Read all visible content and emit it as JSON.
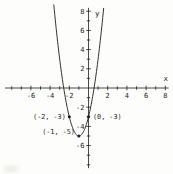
{
  "chart_data": {
    "type": "line",
    "subtype": "quadratic-function-plot",
    "equation": "y = 2(x+1)^2 - 5",
    "coefficients": {
      "a": 2,
      "h": -1,
      "k": -5
    },
    "vertex": {
      "x": -1,
      "y": -5
    },
    "x_axis": {
      "label": "x",
      "min": -8,
      "max": 8,
      "tick_step": 1,
      "labeled_ticks": [
        -6,
        -4,
        -2,
        2,
        4,
        6,
        8
      ]
    },
    "y_axis": {
      "label": "y",
      "min": -8,
      "max": 8,
      "tick_step": 1,
      "labeled_ticks": [
        8,
        6,
        4,
        2,
        -2,
        -4,
        -6
      ]
    },
    "points": [
      {
        "x": -2,
        "y": -3,
        "label": "(-2, -3)",
        "label_position": "left"
      },
      {
        "x": 0,
        "y": -3,
        "label": "(0, -3)",
        "label_position": "right"
      },
      {
        "x": -1,
        "y": -5,
        "label": "(-1, -5)",
        "label_position": "left-above"
      }
    ],
    "grid": false,
    "legend": false,
    "ink_color": "#1c1c1c",
    "background_color": "#fdfdfb"
  }
}
